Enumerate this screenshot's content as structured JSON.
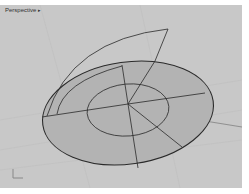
{
  "viewport": {
    "title": "Perspective",
    "menu_icon": "triangle-right",
    "background": "#c8c8c8"
  },
  "scene": {
    "objects": [
      "disc-surface",
      "inner-circle",
      "arc-surface-outline",
      "radial-lines"
    ],
    "disc_fill": "#b4b4b4",
    "line_color": "#2a2a2a"
  },
  "axis_widget": {
    "labels": [
      "x",
      "y"
    ]
  }
}
